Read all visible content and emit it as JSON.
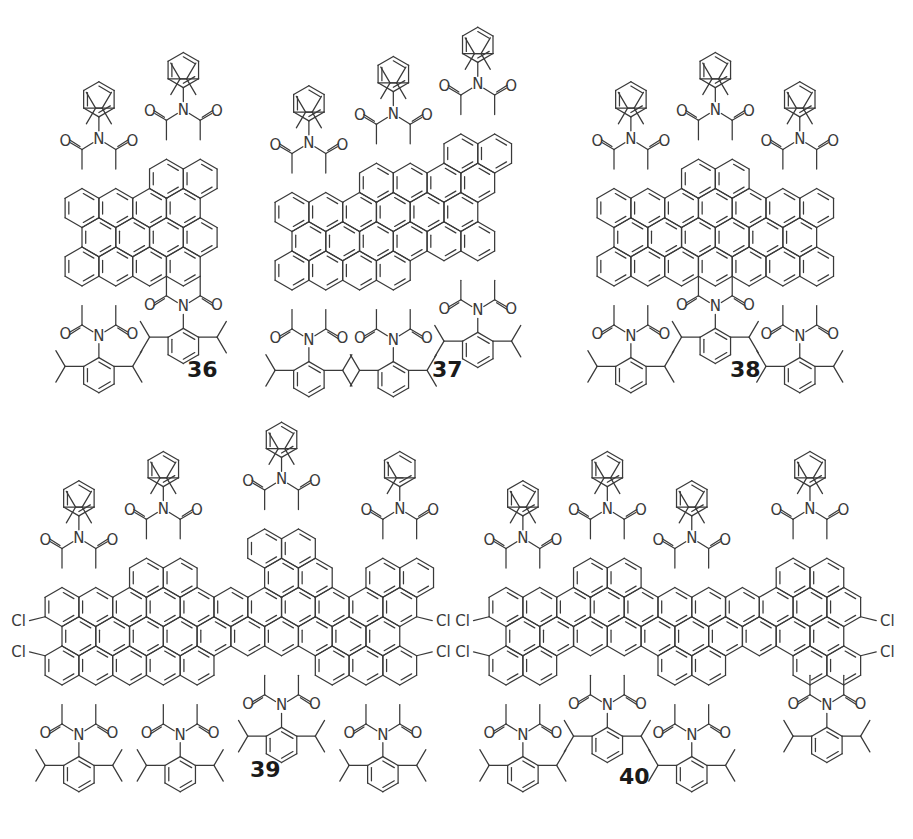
{
  "figure": {
    "colors": {
      "bond": "#3a3a3a",
      "label": "#1a1a1a",
      "background": "#ffffff"
    },
    "atom_labels": {
      "oxygen": "O",
      "nitrogen": "N",
      "chlorine": "Cl"
    },
    "substituent": "2,6-diisopropylphenyl",
    "compounds": [
      {
        "id": "36",
        "label": "36",
        "label_pos": [
          205,
          381
        ],
        "origin": [
          62,
          183
        ],
        "bond": 22.5,
        "rings": [
          [
            0,
            0
          ],
          [
            1,
            0
          ],
          [
            2,
            0
          ],
          [
            3,
            0
          ],
          [
            4,
            0
          ],
          [
            5,
            0
          ],
          [
            6,
            0
          ],
          [
            0.5,
            1
          ],
          [
            1.5,
            1
          ],
          [
            2.5,
            1
          ],
          [
            3.5,
            1
          ],
          [
            4.5,
            1
          ],
          [
            5.5,
            1
          ],
          [
            0,
            2
          ],
          [
            1,
            2
          ],
          [
            2,
            2
          ],
          [
            3,
            2
          ],
          [
            4,
            2
          ],
          [
            5,
            2
          ],
          [
            6,
            2
          ],
          [
            0.5,
            -1
          ],
          [
            1.5,
            -1
          ]
        ],
        "imide_count": 4,
        "chlorine_count": 0
      },
      {
        "id": "37",
        "label": "37",
        "label_pos": [
          450,
          381
        ],
        "origin": [
          282,
          183
        ],
        "bond": 22.5,
        "rings": [],
        "imide_count": 6,
        "chlorine_count": 0
      },
      {
        "id": "38",
        "label": "38",
        "label_pos": [
          748,
          381
        ],
        "origin": [
          600,
          183
        ],
        "bond": 22.5,
        "rings": [],
        "imide_count": 6,
        "chlorine_count": 0
      },
      {
        "id": "39",
        "label": "39",
        "label_pos": [
          268,
          781
        ],
        "origin": [
          40,
          600
        ],
        "bond": 22.5,
        "rings": [],
        "imide_count": 8,
        "chlorine_count": 4,
        "note": "one substituent shows methyl instead of isopropyl"
      },
      {
        "id": "40",
        "label": "40",
        "label_pos": [
          637,
          788
        ],
        "origin": [
          490,
          600
        ],
        "bond": 22.5,
        "rings": [],
        "imide_count": 8,
        "chlorine_count": 4
      }
    ]
  }
}
